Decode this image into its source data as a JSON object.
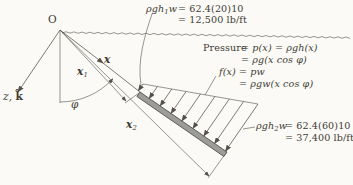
{
  "figure": {
    "origin_label": "O",
    "x_axis_label": "x",
    "z_axis_prefix": "z,",
    "z_axis_k": "k̂",
    "x1_base": "x",
    "x1_sub": "1",
    "x2_base": "x",
    "x2_sub": "2",
    "angle_label": "φ"
  },
  "annotations": {
    "top_load": {
      "term_base": "ρgh",
      "term_sub": "1",
      "term_tail": "w",
      "eq1": "= 62.4(20)10",
      "eq2": "= 12,500 lb/ft"
    },
    "pressure": {
      "word": "Pressure",
      "line1": "= p(x) = ρgh(x)",
      "line2": "= ρg(x cos φ)",
      "line3": "f(x) = pw",
      "line4": "= ρgw(x cos φ)"
    },
    "bottom_load": {
      "term_base": "ρgh",
      "term_sub": "2",
      "term_tail": "w",
      "eq1": "= 62.4(60)10",
      "eq2": "= 37,400 lb/ft"
    }
  },
  "palette": {
    "paper": "#fbfaf6",
    "ink": "#3e3a35",
    "line": "#55504b",
    "plate_fill": "#9c9c9a",
    "plate_edge": "#45423e"
  }
}
